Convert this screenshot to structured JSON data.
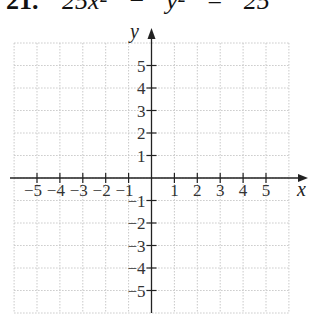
{
  "problem": {
    "number": "21.",
    "equation": "25x² − y² = 25"
  },
  "graph": {
    "x_axis_label": "x",
    "y_axis_label": "y",
    "x_range": [
      -6,
      6
    ],
    "y_range": [
      -6,
      6
    ],
    "grid_step": 1,
    "grid_style": "dotted",
    "x_tick_labels": [
      "−5",
      "−4",
      "−3",
      "−2",
      "−1",
      "1",
      "2",
      "3",
      "4",
      "5"
    ],
    "x_tick_values": [
      -5,
      -4,
      -3,
      -2,
      -1,
      1,
      2,
      3,
      4,
      5
    ],
    "y_tick_labels": [
      "5",
      "4",
      "3",
      "2",
      "1",
      "−1",
      "−2",
      "−3",
      "−4",
      "−5"
    ],
    "y_tick_values": [
      5,
      4,
      3,
      2,
      1,
      -1,
      -2,
      -3,
      -4,
      -5
    ],
    "colors": {
      "grid": "#c9c9c9",
      "axis": "#222222"
    }
  }
}
